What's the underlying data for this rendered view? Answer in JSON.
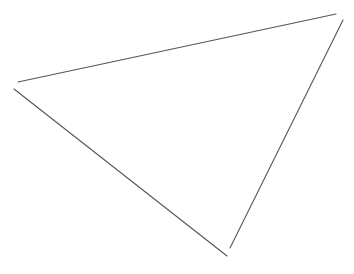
{
  "canvas": {
    "width": 354,
    "height": 274,
    "background": "#ffffff"
  },
  "stroke": {
    "color": "#555555",
    "width": 1.1
  },
  "lines": [
    {
      "name": "top-edge",
      "x1": 18,
      "y1": 82,
      "x2": 336,
      "y2": 14
    },
    {
      "name": "right-edge",
      "x1": 343,
      "y1": 20,
      "x2": 230,
      "y2": 248
    },
    {
      "name": "left-edge",
      "x1": 14,
      "y1": 89,
      "x2": 227,
      "y2": 256
    }
  ]
}
